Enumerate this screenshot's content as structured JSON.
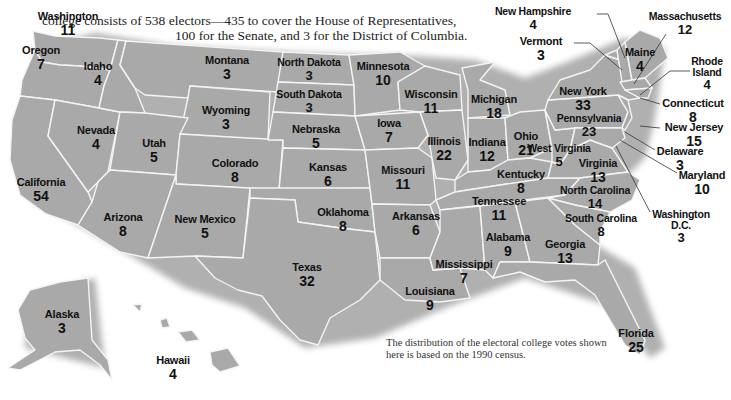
{
  "intro": {
    "line1": "college consists of 538 electors—435 to cover the House of Representatives,",
    "line2": "100 for the Senate, and 3 for the District of Columbia."
  },
  "note": "The distribution of the electoral college votes shown here is based on the 1990 census.",
  "colors": {
    "state_fill": "#a9a9a9",
    "border": "#f4f4f4",
    "text": "#111111"
  },
  "states": [
    {
      "name": "Washington",
      "votes": "11",
      "x": 68,
      "y": 11
    },
    {
      "name": "Oregon",
      "votes": "7",
      "x": 41,
      "y": 45
    },
    {
      "name": "Idaho",
      "votes": "4",
      "x": 98,
      "y": 61
    },
    {
      "name": "Montana",
      "votes": "3",
      "x": 227,
      "y": 55
    },
    {
      "name": "North Dakota",
      "votes": "3",
      "x": 309,
      "y": 57
    },
    {
      "name": "Minnesota",
      "votes": "10",
      "x": 383,
      "y": 61
    },
    {
      "name": "South Dakota",
      "votes": "3",
      "x": 309,
      "y": 89
    },
    {
      "name": "Wyoming",
      "votes": "3",
      "x": 226,
      "y": 105
    },
    {
      "name": "Wisconsin",
      "votes": "11",
      "x": 431,
      "y": 89
    },
    {
      "name": "Michigan",
      "votes": "18",
      "x": 494,
      "y": 94
    },
    {
      "name": "Iowa",
      "votes": "7",
      "x": 389,
      "y": 118
    },
    {
      "name": "Nebraska",
      "votes": "5",
      "x": 316,
      "y": 124
    },
    {
      "name": "Nevada",
      "votes": "4",
      "x": 96,
      "y": 125
    },
    {
      "name": "Utah",
      "votes": "5",
      "x": 154,
      "y": 138
    },
    {
      "name": "Illinois",
      "votes": "22",
      "x": 444,
      "y": 136
    },
    {
      "name": "Indiana",
      "votes": "12",
      "x": 487,
      "y": 137
    },
    {
      "name": "Ohio",
      "votes": "21",
      "x": 526,
      "y": 131
    },
    {
      "name": "Pennsylvania",
      "votes": "23",
      "x": 589,
      "y": 113
    },
    {
      "name": "New York",
      "votes": "33",
      "x": 583,
      "y": 86
    },
    {
      "name": "Colorado",
      "votes": "8",
      "x": 235,
      "y": 158
    },
    {
      "name": "Kansas",
      "votes": "6",
      "x": 328,
      "y": 162
    },
    {
      "name": "West Virginia",
      "votes": "5",
      "x": 559,
      "y": 143
    },
    {
      "name": "Virginia",
      "votes": "13",
      "x": 598,
      "y": 158
    },
    {
      "name": "Missouri",
      "votes": "11",
      "x": 403,
      "y": 165
    },
    {
      "name": "Kentucky",
      "votes": "8",
      "x": 521,
      "y": 169
    },
    {
      "name": "California",
      "votes": "54",
      "x": 41,
      "y": 177
    },
    {
      "name": "North Carolina",
      "votes": "14",
      "x": 595,
      "y": 185
    },
    {
      "name": "Tennessee",
      "votes": "11",
      "x": 499,
      "y": 196
    },
    {
      "name": "Arizona",
      "votes": "8",
      "x": 123,
      "y": 212
    },
    {
      "name": "New Mexico",
      "votes": "5",
      "x": 205,
      "y": 214
    },
    {
      "name": "Oklahoma",
      "votes": "8",
      "x": 343,
      "y": 207
    },
    {
      "name": "Arkansas",
      "votes": "6",
      "x": 416,
      "y": 211
    },
    {
      "name": "South Carolina",
      "votes": "8",
      "x": 601,
      "y": 213
    },
    {
      "name": "Alabama",
      "votes": "9",
      "x": 508,
      "y": 232
    },
    {
      "name": "Georgia",
      "votes": "13",
      "x": 565,
      "y": 239
    },
    {
      "name": "Mississippi",
      "votes": "7",
      "x": 464,
      "y": 259
    },
    {
      "name": "Texas",
      "votes": "32",
      "x": 307,
      "y": 262
    },
    {
      "name": "Louisiana",
      "votes": "9",
      "x": 430,
      "y": 286
    },
    {
      "name": "Florida",
      "votes": "25",
      "x": 636,
      "y": 328
    },
    {
      "name": "Alaska",
      "votes": "3",
      "x": 62,
      "y": 309
    },
    {
      "name": "Hawaii",
      "votes": "4",
      "x": 173,
      "y": 355
    }
  ],
  "callouts": [
    {
      "name": "New Hampshire",
      "votes": "4",
      "x": 533,
      "y": 6
    },
    {
      "name": "Vermont",
      "votes": "3",
      "x": 541,
      "y": 36
    },
    {
      "name": "Massachusetts",
      "votes": "12",
      "x": 685,
      "y": 11
    },
    {
      "name": "Maine",
      "votes": "4",
      "x": 640,
      "y": 47
    },
    {
      "name": "Rhode Island",
      "votes": "4",
      "x": 707,
      "y": 56
    },
    {
      "name": "Connecticut",
      "votes": "8",
      "x": 693,
      "y": 98
    },
    {
      "name": "New Jersey",
      "votes": "15",
      "x": 694,
      "y": 122
    },
    {
      "name": "Delaware",
      "votes": "3",
      "x": 680,
      "y": 146
    },
    {
      "name": "Maryland",
      "votes": "10",
      "x": 702,
      "y": 170
    },
    {
      "name": "Washington D.C.",
      "votes": "3",
      "x": 681,
      "y": 209
    }
  ]
}
